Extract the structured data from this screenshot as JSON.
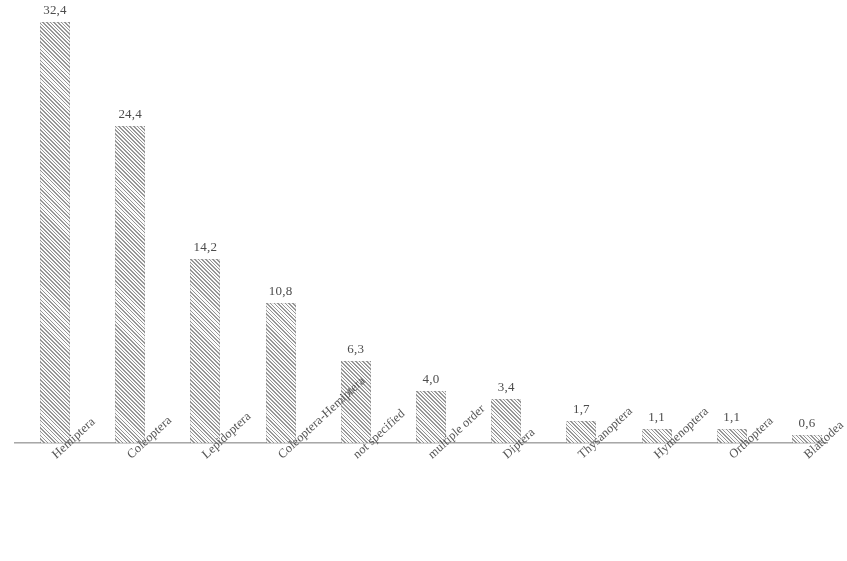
{
  "chart_data": {
    "type": "bar",
    "title": "",
    "subtitle": "",
    "xlabel": "",
    "ylabel": "",
    "grid": false,
    "legend": false,
    "decimal_separator": ",",
    "ylim": [
      0,
      32.4
    ],
    "categories": [
      "Hemiptera",
      "Coleoptera",
      "Lepidoptera",
      "Coleoptera-Hemiptera",
      "not specified",
      "multiple order",
      "Diptera",
      "Thysanoptera",
      "Hymenoptera",
      "Orthoptera",
      "Blattodea"
    ],
    "values": [
      32.4,
      24.4,
      14.2,
      10.8,
      6.3,
      4.0,
      3.4,
      1.7,
      1.1,
      1.1,
      0.6
    ],
    "value_labels": [
      "32,4",
      "24,4",
      "14,2",
      "10,8",
      "6,3",
      "4,0",
      "3,4",
      "1,7",
      "1,1",
      "1,1",
      "0,6"
    ],
    "bar_fill": "#8f8f8f",
    "bar_pattern": "diagonal-hatch",
    "axis_color": "#9a9a9a",
    "label_color": "#555555"
  },
  "style": {
    "label_rotation_deg": -43
  }
}
